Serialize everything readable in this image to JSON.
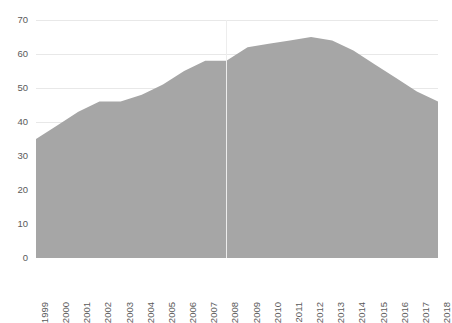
{
  "chart_data": {
    "type": "area",
    "title": "",
    "subtitle": "",
    "xlabel": "",
    "ylabel": "",
    "categories": [
      "1999",
      "2000",
      "2001",
      "2002",
      "2003",
      "2004",
      "2005",
      "2006",
      "2007",
      "2008",
      "2009",
      "2010",
      "2011",
      "2012",
      "2013",
      "2014",
      "2015",
      "2016",
      "2017",
      "2018"
    ],
    "values": [
      35,
      39,
      43,
      46,
      46,
      48,
      51,
      55,
      58,
      58,
      62,
      63,
      64,
      65,
      64,
      61,
      57,
      53,
      49,
      46
    ],
    "series": [
      {
        "name": "",
        "values": [
          35,
          39,
          43,
          46,
          46,
          48,
          51,
          55,
          58,
          58,
          62,
          63,
          64,
          65,
          64,
          61,
          57,
          53,
          49,
          46
        ]
      }
    ],
    "ylim": [
      0,
      70
    ],
    "y_ticks": [
      0,
      10,
      20,
      30,
      40,
      50,
      60,
      70
    ],
    "y_tick_labels": [
      "0",
      "10",
      "20",
      "30",
      "40",
      "50",
      "60",
      "70"
    ],
    "grid": true,
    "grid_axis": "y",
    "legend": false,
    "legend_position": "none",
    "annotations": [],
    "colors": {
      "area_fill": "#a6a6a6",
      "gridline": "#e8e8e8",
      "baseline": "#d9d9d9",
      "axis_text": "#5a5a5a",
      "background": "#ffffff",
      "vertical_marker": "#ededed"
    },
    "vertical_marker_category": "2008"
  }
}
